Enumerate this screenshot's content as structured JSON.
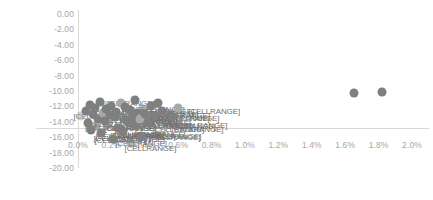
{
  "chart_data": {
    "type": "scatter",
    "title": "",
    "subtitle": "",
    "xlabel": "",
    "ylabel": "",
    "xlim": [
      0.0,
      2.0
    ],
    "ylim": [
      -20.0,
      0.0
    ],
    "grid": false,
    "legend": false,
    "legend_position": "none",
    "x_tick_labels": [
      "0.0%",
      "0.2%",
      "0.4%",
      "0.6%",
      "0.8%",
      "1.0%",
      "1.2%",
      "1.4%",
      "1.6%",
      "1.8%",
      "2.0%"
    ],
    "x_tick_values": [
      0.0,
      0.2,
      0.4,
      0.6,
      0.8,
      1.0,
      1.2,
      1.4,
      1.6,
      1.8,
      2.0
    ],
    "y_tick_labels": [
      "0.00",
      "-2.00",
      "-4.00",
      "-6.00",
      "-8.00",
      "-10.00",
      "-12.00",
      "-14.00",
      "-16.00",
      "-18.00",
      "-20.00"
    ],
    "y_tick_values": [
      0.0,
      -2.0,
      -4.0,
      -6.0,
      -8.0,
      -10.0,
      -12.0,
      -14.0,
      -16.0,
      -18.0,
      -20.0
    ],
    "marker_color": "#7f7f7f",
    "axis_color": "#d9d9d9",
    "tick_label_color": "#a6a6a6",
    "data_label_text": "[CELLRANGE]",
    "series": [
      {
        "name": "Series1",
        "points": [
          {
            "x": 0.02,
            "y": -13.3,
            "label": "[CELLRANGE]"
          },
          {
            "x": 0.05,
            "y": -12.6,
            "label": "[CELLRANGE]"
          },
          {
            "x": 0.06,
            "y": -14.1,
            "label": "[CELLRANGE]"
          },
          {
            "x": 0.07,
            "y": -11.8,
            "label": "[CELLRANGE]"
          },
          {
            "x": 0.08,
            "y": -15.0,
            "label": "[CELLRANGE]"
          },
          {
            "x": 0.09,
            "y": -13.0,
            "label": "[CELLRANGE]"
          },
          {
            "x": 0.1,
            "y": -12.2,
            "label": "[CELLRANGE]"
          },
          {
            "x": 0.11,
            "y": -14.6,
            "label": "[CELLRANGE]"
          },
          {
            "x": 0.12,
            "y": -13.6,
            "label": "[CELLRANGE]"
          },
          {
            "x": 0.13,
            "y": -11.4,
            "label": "[CELLRANGE]"
          },
          {
            "x": 0.14,
            "y": -15.5,
            "label": "[CELLRANGE]"
          },
          {
            "x": 0.15,
            "y": -12.9,
            "label": "[CELLRANGE]"
          },
          {
            "x": 0.16,
            "y": -13.9,
            "label": "[CELLRANGE]"
          },
          {
            "x": 0.17,
            "y": -12.4,
            "label": "[CELLRANGE]"
          },
          {
            "x": 0.18,
            "y": -14.3,
            "label": "[CELLRANGE]"
          },
          {
            "x": 0.19,
            "y": -13.1,
            "label": "[CELLRANGE]"
          },
          {
            "x": 0.2,
            "y": -11.9,
            "label": "[CELLRANGE]"
          },
          {
            "x": 0.21,
            "y": -16.2,
            "label": "[CELLRANGE]"
          },
          {
            "x": 0.22,
            "y": -13.4,
            "label": "[CELLRANGE]"
          },
          {
            "x": 0.23,
            "y": -12.7,
            "label": "[CELLRANGE]"
          },
          {
            "x": 0.24,
            "y": -14.8,
            "label": "[CELLRANGE]"
          },
          {
            "x": 0.25,
            "y": -13.2,
            "label": "[CELLRANGE]"
          },
          {
            "x": 0.26,
            "y": -11.6,
            "label": "[CELLRANGE]"
          },
          {
            "x": 0.27,
            "y": -15.2,
            "label": "[CELLRANGE]"
          },
          {
            "x": 0.28,
            "y": -12.1,
            "label": "[CELLRANGE]"
          },
          {
            "x": 0.29,
            "y": -13.8,
            "label": "[CELLRANGE]"
          },
          {
            "x": 0.3,
            "y": -14.0,
            "label": "[CELLRANGE]"
          },
          {
            "x": 0.31,
            "y": -12.5,
            "label": "[CELLRANGE]"
          },
          {
            "x": 0.32,
            "y": -16.8,
            "label": "[CELLRANGE]"
          },
          {
            "x": 0.33,
            "y": -13.5,
            "label": "[CELLRANGE]"
          },
          {
            "x": 0.34,
            "y": -11.2,
            "label": "[CELLRANGE]"
          },
          {
            "x": 0.35,
            "y": -14.5,
            "label": "[CELLRANGE]"
          },
          {
            "x": 0.36,
            "y": -12.8,
            "label": "[CELLRANGE]"
          },
          {
            "x": 0.37,
            "y": -13.7,
            "label": "[CELLRANGE]"
          },
          {
            "x": 0.38,
            "y": -15.8,
            "label": "[CELLRANGE]"
          },
          {
            "x": 0.39,
            "y": -12.3,
            "label": "[CELLRANGE]"
          },
          {
            "x": 0.4,
            "y": -13.0,
            "label": "[CELLRANGE]"
          },
          {
            "x": 0.42,
            "y": -14.2,
            "label": "[CELLRANGE]"
          },
          {
            "x": 0.44,
            "y": -12.0,
            "label": "[CELLRANGE]"
          },
          {
            "x": 0.46,
            "y": -13.3,
            "label": "[CELLRANGE]"
          },
          {
            "x": 0.48,
            "y": -11.5,
            "label": "[CELLRANGE]"
          },
          {
            "x": 0.5,
            "y": -12.6,
            "label": "[CELLRANGE]"
          },
          {
            "x": 0.53,
            "y": -12.9,
            "label": "[CELLRANGE]"
          },
          {
            "x": 0.56,
            "y": -13.4,
            "label": "[CELLRANGE]"
          },
          {
            "x": 0.6,
            "y": -12.2,
            "label": "[CELLRANGE]"
          },
          {
            "x": 1.65,
            "y": -10.2,
            "label": ""
          },
          {
            "x": 1.82,
            "y": -10.1,
            "label": ""
          }
        ]
      }
    ]
  }
}
